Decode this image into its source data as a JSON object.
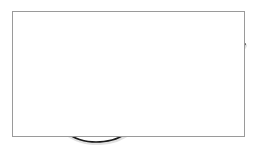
{
  "figure": {
    "background_color": "#ffffff",
    "frame_color": "#9a9a9a",
    "frame_rect": {
      "x": 12,
      "y": 11,
      "width": 233,
      "height": 126
    }
  },
  "chart_data": {
    "type": "line",
    "title": "",
    "subtitle": "",
    "xlabel": "",
    "ylabel": "",
    "xlim": [
      0,
      233
    ],
    "ylim": [
      126,
      0
    ],
    "grid": false,
    "legend": [],
    "legend_position": "none",
    "axis_ticks_visible": false,
    "tick_labels_x": [],
    "tick_labels_y": [],
    "annotations": [],
    "series": [
      {
        "name": "curve",
        "color": "#1a1a1a",
        "line_width": 1.6,
        "style": "solid",
        "shadow_color": "#c8c8c8",
        "description": "J-shaped curve: steep fall from upper left, broad minimum near left-of-center, then an uneven stepped rise to the upper right",
        "points": [
          {
            "x": 30,
            "y": 43
          },
          {
            "x": 28,
            "y": 52
          },
          {
            "x": 27,
            "y": 62
          },
          {
            "x": 27,
            "y": 72
          },
          {
            "x": 28,
            "y": 82
          },
          {
            "x": 30,
            "y": 91
          },
          {
            "x": 34,
            "y": 100
          },
          {
            "x": 39,
            "y": 108
          },
          {
            "x": 46,
            "y": 116
          },
          {
            "x": 54,
            "y": 122
          },
          {
            "x": 63,
            "y": 127
          },
          {
            "x": 72,
            "y": 130
          },
          {
            "x": 80,
            "y": 131
          },
          {
            "x": 88,
            "y": 131
          },
          {
            "x": 96,
            "y": 130
          },
          {
            "x": 104,
            "y": 128
          },
          {
            "x": 110,
            "y": 125
          },
          {
            "x": 114,
            "y": 123
          },
          {
            "x": 118,
            "y": 122
          },
          {
            "x": 124,
            "y": 119
          },
          {
            "x": 130,
            "y": 117
          },
          {
            "x": 136,
            "y": 114
          },
          {
            "x": 142,
            "y": 110
          },
          {
            "x": 147,
            "y": 108
          },
          {
            "x": 153,
            "y": 107
          },
          {
            "x": 158,
            "y": 106
          },
          {
            "x": 163,
            "y": 104
          },
          {
            "x": 169,
            "y": 100
          },
          {
            "x": 175,
            "y": 96
          },
          {
            "x": 181,
            "y": 91
          },
          {
            "x": 186,
            "y": 88
          },
          {
            "x": 191,
            "y": 87
          },
          {
            "x": 195,
            "y": 84
          },
          {
            "x": 200,
            "y": 78
          },
          {
            "x": 206,
            "y": 70
          },
          {
            "x": 212,
            "y": 62
          },
          {
            "x": 218,
            "y": 54
          },
          {
            "x": 224,
            "y": 45
          },
          {
            "x": 229,
            "y": 39
          },
          {
            "x": 233,
            "y": 33
          }
        ]
      }
    ]
  }
}
